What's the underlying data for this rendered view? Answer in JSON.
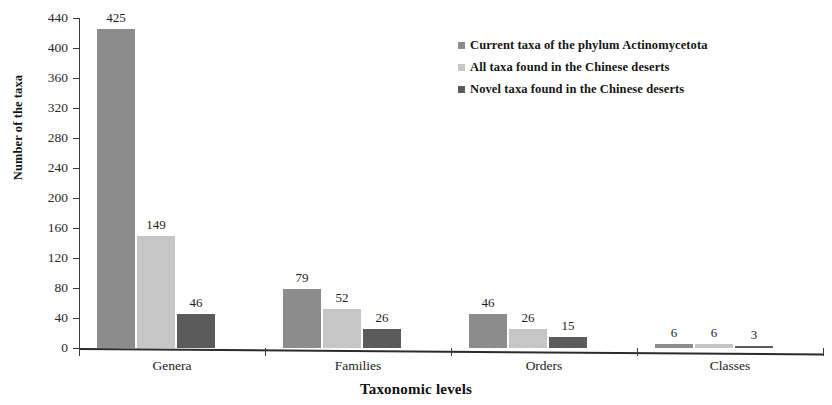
{
  "chart_data": {
    "type": "bar",
    "title": "",
    "xlabel": "Taxonomic levels",
    "ylabel": "Number of the taxa",
    "categories": [
      "Genera",
      "Families",
      "Orders",
      "Classes"
    ],
    "series": [
      {
        "name": "Current taxa of the phylum Actinomycetota",
        "color": "#8c8c8c",
        "values": [
          425,
          79,
          46,
          6
        ]
      },
      {
        "name": "All taxa found in the Chinese deserts",
        "color": "#c6c6c6",
        "values": [
          149,
          52,
          26,
          6
        ]
      },
      {
        "name": "Novel taxa found in the Chinese deserts",
        "color": "#5b5b5b",
        "values": [
          46,
          26,
          15,
          3
        ]
      }
    ],
    "ylim": [
      0,
      440
    ],
    "yticks": [
      0,
      40,
      80,
      120,
      160,
      200,
      240,
      280,
      320,
      360,
      400,
      440
    ],
    "ytick_labels": [
      "0",
      "40",
      "80",
      "120",
      "160",
      "200",
      "240",
      "280",
      "320",
      "360",
      "400",
      "440"
    ],
    "grid": false,
    "legend_position": "upper right",
    "data_labels": true
  },
  "legend": {
    "entries": [
      {
        "label": "Current taxa of the phylum Actinomycetota",
        "color": "#8c8c8c"
      },
      {
        "label": "All taxa found in the Chinese deserts",
        "color": "#c6c6c6"
      },
      {
        "label": "Novel taxa found in the Chinese deserts",
        "color": "#5b5b5b"
      }
    ]
  }
}
